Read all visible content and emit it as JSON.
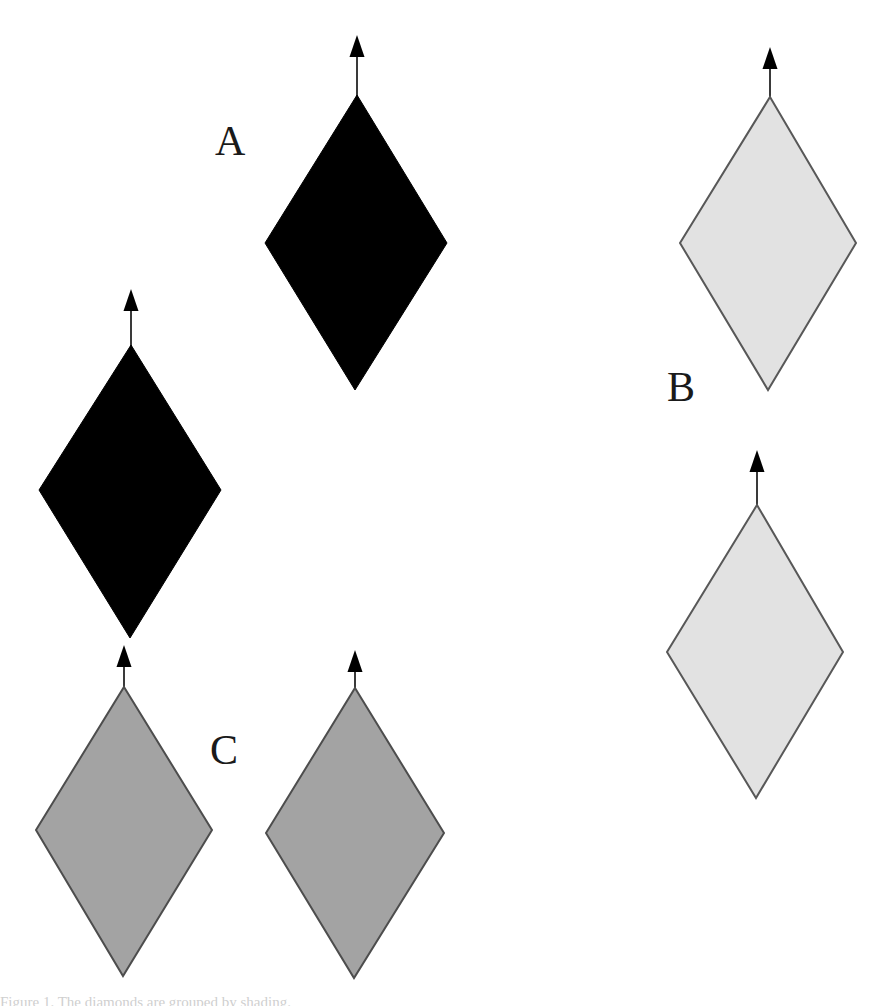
{
  "figure": {
    "width": 893,
    "height": 1006,
    "background_color": "#ffffff",
    "caption_sliver": "Figure 1. The diamonds are grouped by shading."
  },
  "labels": [
    {
      "id": "A",
      "text": "A",
      "x": 215,
      "y": 120,
      "color": "#1a1a1a"
    },
    {
      "id": "B",
      "text": "B",
      "x": 667,
      "y": 366,
      "color": "#1a1a1a"
    },
    {
      "id": "C",
      "text": "C",
      "x": 210,
      "y": 729,
      "color": "#1a1a1a"
    }
  ],
  "palette": {
    "black_fill": "#000000",
    "black_stroke": "#000000",
    "light_gray_fill": "#e2e2e2",
    "light_gray_stroke": "#585858",
    "mid_gray_fill": "#a3a3a3",
    "mid_gray_stroke": "#4d4d4d",
    "arrow_shaft": "#3a3a3a",
    "arrow_head": "#000000",
    "background": "#ffffff"
  },
  "shapes": [
    {
      "name": "diamond-a-1",
      "group": "A",
      "fill": "#000000",
      "stroke": "#000000",
      "stroke_width": 1,
      "top": {
        "x": 357,
        "y": 95
      },
      "right": {
        "x": 447,
        "y": 243
      },
      "bottom": {
        "x": 355,
        "y": 390
      },
      "left": {
        "x": 265,
        "y": 243
      },
      "arrow": {
        "tip_y": 35,
        "base_y": 95,
        "x": 357
      }
    },
    {
      "name": "diamond-a-2",
      "group": "A",
      "fill": "#000000",
      "stroke": "#000000",
      "stroke_width": 1,
      "top": {
        "x": 131,
        "y": 345
      },
      "right": {
        "x": 221,
        "y": 490
      },
      "bottom": {
        "x": 130,
        "y": 638
      },
      "left": {
        "x": 39,
        "y": 490
      },
      "arrow": {
        "tip_y": 289,
        "base_y": 345,
        "x": 131
      }
    },
    {
      "name": "diamond-b-1",
      "group": "B",
      "fill": "#e2e2e2",
      "stroke": "#585858",
      "stroke_width": 2,
      "top": {
        "x": 770,
        "y": 97
      },
      "right": {
        "x": 856,
        "y": 243
      },
      "bottom": {
        "x": 768,
        "y": 390
      },
      "left": {
        "x": 680,
        "y": 243
      },
      "arrow": {
        "tip_y": 47,
        "base_y": 97,
        "x": 770
      }
    },
    {
      "name": "diamond-b-2",
      "group": "B",
      "fill": "#e2e2e2",
      "stroke": "#585858",
      "stroke_width": 2,
      "top": {
        "x": 757,
        "y": 505
      },
      "right": {
        "x": 843,
        "y": 652
      },
      "bottom": {
        "x": 756,
        "y": 798
      },
      "left": {
        "x": 667,
        "y": 652
      },
      "arrow": {
        "tip_y": 450,
        "base_y": 505,
        "x": 757
      }
    },
    {
      "name": "diamond-c-1",
      "group": "C",
      "fill": "#a3a3a3",
      "stroke": "#4d4d4d",
      "stroke_width": 2,
      "top": {
        "x": 124,
        "y": 687
      },
      "right": {
        "x": 212,
        "y": 830
      },
      "bottom": {
        "x": 123,
        "y": 976
      },
      "left": {
        "x": 36,
        "y": 830
      },
      "arrow": {
        "tip_y": 645,
        "base_y": 687,
        "x": 124
      }
    },
    {
      "name": "diamond-c-2",
      "group": "C",
      "fill": "#a3a3a3",
      "stroke": "#4d4d4d",
      "stroke_width": 2,
      "top": {
        "x": 355,
        "y": 688
      },
      "right": {
        "x": 444,
        "y": 833
      },
      "bottom": {
        "x": 354,
        "y": 978
      },
      "left": {
        "x": 266,
        "y": 833
      },
      "arrow": {
        "tip_y": 650,
        "base_y": 688,
        "x": 355
      }
    }
  ],
  "arrow_style": {
    "shaft_width": 2,
    "head_width": 15,
    "head_height": 22
  }
}
